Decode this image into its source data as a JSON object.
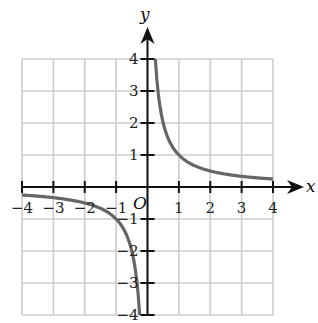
{
  "chart_data": {
    "type": "line",
    "title": "",
    "function": "y = 1/x",
    "xlabel": "x",
    "ylabel": "y",
    "origin_label": "O",
    "xlim": [
      -4,
      4
    ],
    "ylim": [
      -4,
      4
    ],
    "grid": true,
    "x_ticks": [
      -4,
      -3,
      -2,
      -1,
      1,
      2,
      3,
      4
    ],
    "y_ticks": [
      -4,
      -3,
      -2,
      -1,
      1,
      2,
      3,
      4
    ],
    "x_tick_labels": [
      "−4",
      "−3",
      "−2",
      "−1",
      "1",
      "2",
      "3",
      "4"
    ],
    "y_tick_labels": [
      "−4",
      "−3",
      "−2",
      "−1",
      "1",
      "2",
      "3",
      "4"
    ],
    "series": [
      {
        "name": "positive branch",
        "x": [
          0.25,
          0.3,
          0.4,
          0.5,
          0.75,
          1,
          1.5,
          2,
          2.5,
          3,
          3.5,
          4
        ],
        "values": [
          4,
          3.33,
          2.5,
          2,
          1.33,
          1,
          0.67,
          0.5,
          0.4,
          0.33,
          0.29,
          0.25
        ]
      },
      {
        "name": "negative branch",
        "x": [
          -4,
          -3.5,
          -3,
          -2.5,
          -2,
          -1.5,
          -1,
          -0.75,
          -0.5,
          -0.4,
          -0.3,
          -0.25
        ],
        "values": [
          -0.25,
          -0.29,
          -0.33,
          -0.4,
          -0.5,
          -0.67,
          -1,
          -1.33,
          -2,
          -2.5,
          -3.33,
          -4
        ]
      }
    ],
    "colors": {
      "curve": "#666666",
      "grid": "#cccccc",
      "axes": "#111111"
    }
  }
}
